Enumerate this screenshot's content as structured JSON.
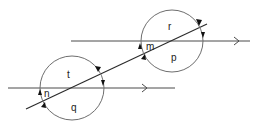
{
  "diagram": {
    "type": "parallel-lines-transversal-angles",
    "colors": {
      "line": "#2a2a2a",
      "circle": "#6e6e6e",
      "label": "#222222"
    },
    "labels": {
      "upper_top": "r",
      "upper_left": "m",
      "upper_bottom": "p",
      "lower_top": "t",
      "lower_left": "n",
      "lower_bottom": "q"
    },
    "elements": {
      "upper_parallel_line": "upper horizontal line with arrow",
      "lower_parallel_line": "lower horizontal line with arrow",
      "transversal": "slanted transversal line",
      "upper_circle": "angle circle at upper intersection",
      "lower_circle": "angle circle at lower intersection"
    }
  }
}
